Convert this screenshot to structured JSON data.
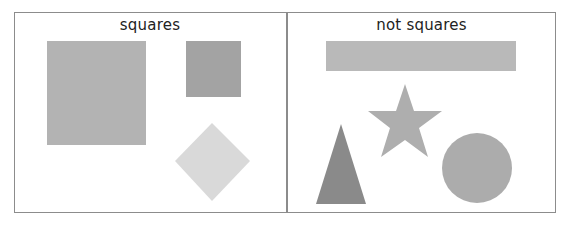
{
  "panels": [
    {
      "title": "squares",
      "shapes": [
        {
          "name": "large-square",
          "type": "square",
          "color": "#b3b3b3"
        },
        {
          "name": "small-square",
          "type": "square",
          "color": "#a3a3a3"
        },
        {
          "name": "diamond-square",
          "type": "square-rotated",
          "color": "#d9d9d9"
        }
      ]
    },
    {
      "title": "not squares",
      "shapes": [
        {
          "name": "rectangle",
          "type": "rectangle",
          "color": "#b9b9b9"
        },
        {
          "name": "star",
          "type": "star",
          "color": "#aeaeae"
        },
        {
          "name": "triangle",
          "type": "triangle",
          "color": "#8a8a8a"
        },
        {
          "name": "circle",
          "type": "circle",
          "color": "#acacac"
        }
      ]
    }
  ]
}
